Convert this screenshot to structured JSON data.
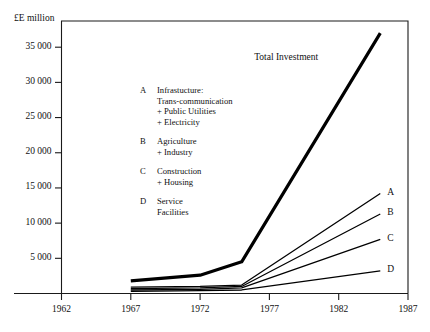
{
  "chart_data": {
    "type": "line",
    "title": "",
    "xlabel": "",
    "ylabel": "£E million",
    "xlim": [
      1962,
      1987
    ],
    "ylim": [
      0,
      37500
    ],
    "xticks": [
      1962,
      1967,
      1972,
      1977,
      1982,
      1987
    ],
    "xtick_labels": [
      "1962",
      "1967",
      "1972",
      "1977",
      "1982",
      "1987"
    ],
    "yticks": [
      5000,
      10000,
      15000,
      20000,
      25000,
      30000,
      35000
    ],
    "ytick_labels": [
      "5 000",
      "10 000",
      "15 000",
      "20 000",
      "25 000",
      "30 000",
      "35 000"
    ],
    "grid": false,
    "legend_position": "inside-upper-left",
    "annotations": [
      {
        "text": "Total Investment",
        "x": 1978.5,
        "y": 33500
      }
    ],
    "series": [
      {
        "name": "Total Investment",
        "label": "Total Investment",
        "linewidth": 3.2,
        "color": "#000000",
        "x": [
          1967,
          1972,
          1975,
          1985
        ],
        "values": [
          1800,
          2600,
          4500,
          37000
        ]
      },
      {
        "name": "A",
        "label": "A",
        "linewidth": 1.3,
        "color": "#000000",
        "x": [
          1967,
          1972,
          1975,
          1985
        ],
        "values": [
          900,
          1000,
          1200,
          14200
        ]
      },
      {
        "name": "B",
        "label": "B",
        "linewidth": 1.3,
        "color": "#000000",
        "x": [
          1967,
          1972,
          1975,
          1985
        ],
        "values": [
          700,
          800,
          1000,
          11300
        ]
      },
      {
        "name": "C",
        "label": "C",
        "linewidth": 1.3,
        "color": "#000000",
        "x": [
          1967,
          1972,
          1975,
          1985
        ],
        "values": [
          500,
          600,
          800,
          7700
        ]
      },
      {
        "name": "D",
        "label": "D",
        "linewidth": 1.3,
        "color": "#000000",
        "x": [
          1967,
          1972,
          1975,
          1985
        ],
        "values": [
          300,
          400,
          500,
          3200
        ]
      }
    ],
    "legend_entries": [
      {
        "key": "A",
        "text": "Infrastucture:\nTrans-communication\n+ Public Utilities\n+ Electricity"
      },
      {
        "key": "B",
        "text": "Agriculture\n+ Industry"
      },
      {
        "key": "C",
        "text": "Construction\n+ Housing"
      },
      {
        "key": "D",
        "text": "Service\nFacilities"
      }
    ]
  },
  "colors": {
    "axis": "#1a1a1a",
    "line": "#000000",
    "background": "#ffffff",
    "text": "#111111"
  }
}
